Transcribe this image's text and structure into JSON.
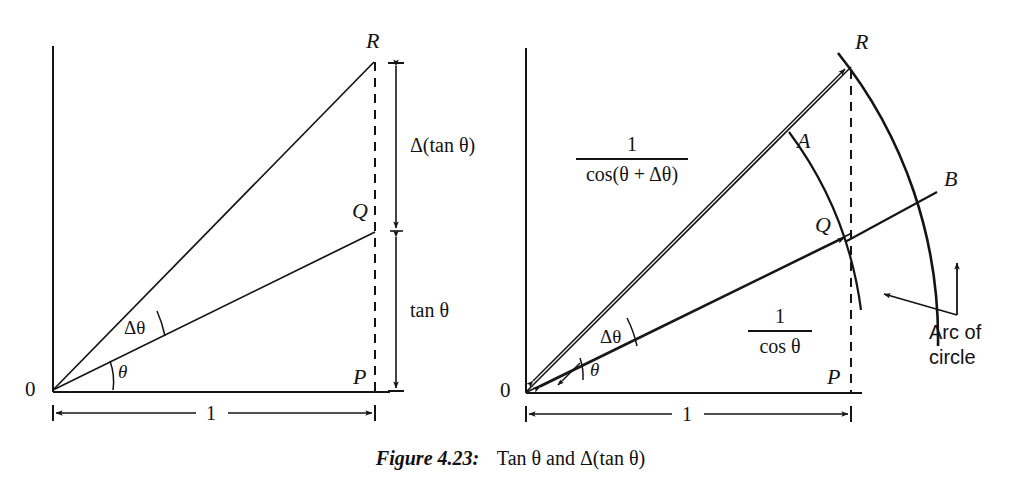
{
  "figure": {
    "caption_head": "Figure 4.23:",
    "caption_body": "Tan θ and Δ(tan θ)",
    "ink_color": "#141414",
    "background_color": "#ffffff"
  },
  "left_diagram": {
    "name": "tan-theta-triangle",
    "origin_label": "0",
    "points": [
      {
        "id": "R",
        "label": "R"
      },
      {
        "id": "Q",
        "label": "Q"
      },
      {
        "id": "P",
        "label": "P"
      }
    ],
    "angles": [
      {
        "id": "theta",
        "label": "θ"
      },
      {
        "id": "delta-theta",
        "label": "Δθ"
      }
    ],
    "vertical_dimensions": [
      {
        "id": "delta-tan-theta",
        "label": "Δ(tan θ)"
      },
      {
        "id": "tan-theta",
        "label": "tan θ"
      }
    ],
    "horizontal_dimension": {
      "id": "unit-base",
      "label": "1"
    }
  },
  "right_diagram": {
    "name": "secant-arc-construction",
    "origin_label": "0",
    "points": [
      {
        "id": "R",
        "label": "R"
      },
      {
        "id": "A",
        "label": "A"
      },
      {
        "id": "B",
        "label": "B"
      },
      {
        "id": "Q",
        "label": "Q"
      },
      {
        "id": "P",
        "label": "P"
      }
    ],
    "angles": [
      {
        "id": "theta",
        "label": "θ"
      },
      {
        "id": "delta-theta",
        "label": "Δθ"
      }
    ],
    "length_labels": [
      {
        "id": "sec-theta-plus-delta",
        "numerator": "1",
        "denominator": "cos(θ + Δθ)"
      },
      {
        "id": "sec-theta",
        "numerator": "1",
        "denominator": "cos θ"
      }
    ],
    "annotation": {
      "id": "arc-of-circle",
      "line1": "Arc of",
      "line2": "circle"
    },
    "horizontal_dimension": {
      "id": "unit-base",
      "label": "1"
    }
  }
}
